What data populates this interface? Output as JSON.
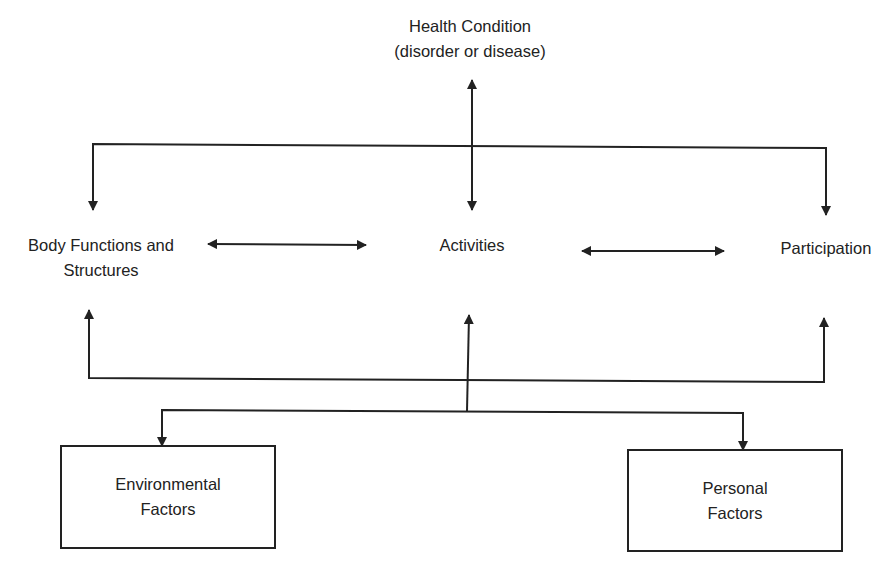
{
  "diagram": {
    "nodes": {
      "health_condition": {
        "line1": "Health Condition",
        "line2": "(disorder or disease)"
      },
      "body_functions": {
        "line1": "Body Functions and",
        "line2": "Structures"
      },
      "activities": {
        "line1": "Activities"
      },
      "participation": {
        "line1": "Participation"
      },
      "environmental_factors": {
        "line1": "Environmental",
        "line2": "Factors"
      },
      "personal_factors": {
        "line1": "Personal",
        "line2": "Factors"
      }
    },
    "edges": [
      {
        "from": "health_condition",
        "to": "activities",
        "type": "bidirectional"
      },
      {
        "from": "health_condition",
        "to": "body_functions",
        "type": "directed"
      },
      {
        "from": "health_condition",
        "to": "participation",
        "type": "directed"
      },
      {
        "from": "body_functions",
        "to": "activities",
        "type": "bidirectional"
      },
      {
        "from": "activities",
        "to": "participation",
        "type": "bidirectional"
      },
      {
        "from": "contextual_factors",
        "to": "body_functions",
        "type": "directed"
      },
      {
        "from": "contextual_factors",
        "to": "activities",
        "type": "directed"
      },
      {
        "from": "contextual_factors",
        "to": "participation",
        "type": "directed"
      },
      {
        "from": "activities",
        "to": "environmental_factors",
        "type": "directed"
      },
      {
        "from": "activities",
        "to": "personal_factors",
        "type": "directed"
      }
    ],
    "colors": {
      "line": "#222222",
      "text": "#222222",
      "background": "#ffffff"
    }
  }
}
